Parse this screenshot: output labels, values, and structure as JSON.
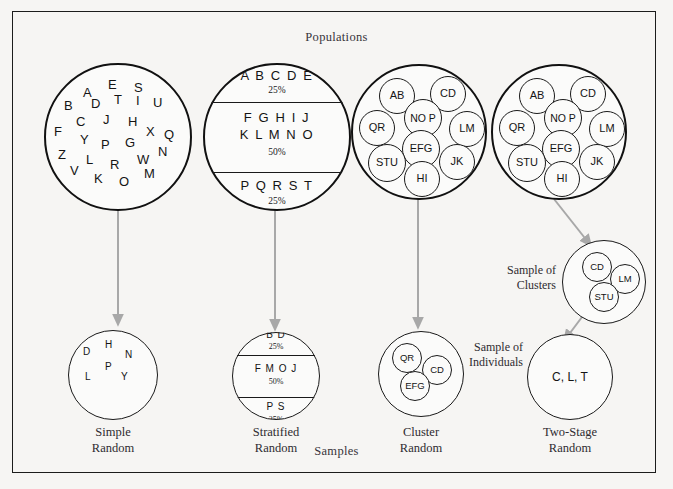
{
  "figure": {
    "header_top": "Populations",
    "header_bottom": "Samples",
    "accent_arrow_color": "#a3a3a3",
    "stroke_color": "#141414",
    "background_color": "#f6f5f3"
  },
  "columns": [
    {
      "key": "simple",
      "caption_line1": "Simple",
      "caption_line2": "Random",
      "population": {
        "type": "scatter-letters",
        "letters": [
          {
            "ch": "A",
            "x": 39,
            "y": 23,
            "size": 13
          },
          {
            "ch": "E",
            "x": 64,
            "y": 15,
            "size": 13
          },
          {
            "ch": "S",
            "x": 90,
            "y": 18,
            "size": 13
          },
          {
            "ch": "B",
            "x": 20,
            "y": 36,
            "size": 13
          },
          {
            "ch": "D",
            "x": 47,
            "y": 34,
            "size": 13
          },
          {
            "ch": "T",
            "x": 70,
            "y": 30,
            "size": 13
          },
          {
            "ch": "I",
            "x": 92,
            "y": 31,
            "size": 13
          },
          {
            "ch": "U",
            "x": 109,
            "y": 33,
            "size": 13
          },
          {
            "ch": "C",
            "x": 32,
            "y": 52,
            "size": 13
          },
          {
            "ch": "J",
            "x": 59,
            "y": 50,
            "size": 13
          },
          {
            "ch": "H",
            "x": 84,
            "y": 52,
            "size": 13
          },
          {
            "ch": "F",
            "x": 10,
            "y": 62,
            "size": 13
          },
          {
            "ch": "X",
            "x": 102,
            "y": 62,
            "size": 13
          },
          {
            "ch": "Q",
            "x": 120,
            "y": 65,
            "size": 13
          },
          {
            "ch": "Y",
            "x": 36,
            "y": 70,
            "size": 13
          },
          {
            "ch": "P",
            "x": 57,
            "y": 75,
            "size": 13
          },
          {
            "ch": "G",
            "x": 81,
            "y": 73,
            "size": 13
          },
          {
            "ch": "Z",
            "x": 14,
            "y": 85,
            "size": 13
          },
          {
            "ch": "N",
            "x": 114,
            "y": 82,
            "size": 13
          },
          {
            "ch": "L",
            "x": 42,
            "y": 90,
            "size": 13
          },
          {
            "ch": "R",
            "x": 66,
            "y": 95,
            "size": 13
          },
          {
            "ch": "W",
            "x": 93,
            "y": 90,
            "size": 13
          },
          {
            "ch": "V",
            "x": 26,
            "y": 101,
            "size": 13
          },
          {
            "ch": "K",
            "x": 50,
            "y": 109,
            "size": 13
          },
          {
            "ch": "O",
            "x": 75,
            "y": 112,
            "size": 13
          },
          {
            "ch": "M",
            "x": 100,
            "y": 104,
            "size": 13
          }
        ]
      },
      "sample": {
        "type": "scatter-letters",
        "letters": [
          {
            "ch": "D",
            "x": 15,
            "y": 17,
            "size": 10
          },
          {
            "ch": "H",
            "x": 37,
            "y": 10,
            "size": 10
          },
          {
            "ch": "N",
            "x": 57,
            "y": 20,
            "size": 10
          },
          {
            "ch": "P",
            "x": 37,
            "y": 32,
            "size": 10
          },
          {
            "ch": "L",
            "x": 17,
            "y": 42,
            "size": 10
          },
          {
            "ch": "Y",
            "x": 53,
            "y": 42,
            "size": 10
          }
        ]
      }
    },
    {
      "key": "stratified",
      "caption_line1": "Stratified",
      "caption_line2": "Random",
      "population": {
        "type": "strata",
        "bands": [
          {
            "text": "A B C D E",
            "pct": "25%"
          },
          {
            "text": "F G H I J",
            "text2": "K L M N O",
            "pct": "50%"
          },
          {
            "text": "P Q R S T",
            "pct": "25%"
          }
        ]
      },
      "sample": {
        "type": "strata",
        "bands": [
          {
            "text": "B D",
            "pct": "25%"
          },
          {
            "text": "F M O J",
            "pct": "50%"
          },
          {
            "text": "P S",
            "pct": "25%"
          }
        ]
      }
    },
    {
      "key": "cluster",
      "caption_line1": "Cluster",
      "caption_line2": "Random",
      "population": {
        "type": "clusters",
        "clusters": [
          {
            "label": "AB",
            "x": 28,
            "y": 14,
            "d": 36
          },
          {
            "label": "CD",
            "x": 79,
            "y": 12,
            "d": 36
          },
          {
            "label": "NO P",
            "x": 53,
            "y": 35,
            "d": 38
          },
          {
            "label": "QR",
            "x": 8,
            "y": 46,
            "d": 36
          },
          {
            "label": "LM",
            "x": 98,
            "y": 47,
            "d": 36
          },
          {
            "label": "EFG",
            "x": 51,
            "y": 66,
            "d": 38
          },
          {
            "label": "STU",
            "x": 17,
            "y": 80,
            "d": 38
          },
          {
            "label": "JK",
            "x": 88,
            "y": 80,
            "d": 36
          },
          {
            "label": "HI",
            "x": 53,
            "y": 97,
            "d": 36
          }
        ]
      },
      "sample": {
        "type": "clusters",
        "clusters": [
          {
            "label": "QR",
            "x": 14,
            "y": 12,
            "d": 30
          },
          {
            "label": "CD",
            "x": 44,
            "y": 24,
            "d": 30
          },
          {
            "label": "EFG",
            "x": 22,
            "y": 40,
            "d": 30
          }
        ]
      }
    },
    {
      "key": "twostage",
      "caption_line1": "Two-Stage",
      "caption_line2": "Random",
      "label_clusters_line1": "Sample of",
      "label_clusters_line2": "Clusters",
      "label_individuals_line1": "Sample of",
      "label_individuals_line2": "Individuals",
      "population": {
        "type": "clusters",
        "clusters": [
          {
            "label": "AB",
            "x": 28,
            "y": 14,
            "d": 36
          },
          {
            "label": "CD",
            "x": 79,
            "y": 12,
            "d": 36
          },
          {
            "label": "NO P",
            "x": 53,
            "y": 35,
            "d": 38
          },
          {
            "label": "QR",
            "x": 8,
            "y": 46,
            "d": 36
          },
          {
            "label": "LM",
            "x": 98,
            "y": 47,
            "d": 36
          },
          {
            "label": "EFG",
            "x": 51,
            "y": 66,
            "d": 38
          },
          {
            "label": "STU",
            "x": 17,
            "y": 80,
            "d": 38
          },
          {
            "label": "JK",
            "x": 88,
            "y": 80,
            "d": 36
          },
          {
            "label": "HI",
            "x": 53,
            "y": 97,
            "d": 36
          }
        ]
      },
      "cluster_sample": {
        "type": "clusters",
        "clusters": [
          {
            "label": "CD",
            "x": 20,
            "y": 12,
            "d": 30
          },
          {
            "label": "LM",
            "x": 48,
            "y": 24,
            "d": 30
          },
          {
            "label": "STU",
            "x": 27,
            "y": 42,
            "d": 30
          }
        ]
      },
      "individual_sample": {
        "type": "text",
        "text": "C, L, T"
      }
    }
  ]
}
